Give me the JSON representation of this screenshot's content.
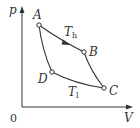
{
  "diagram": {
    "type": "pV-cycle",
    "axes": {
      "y_label": "p",
      "x_label": "V",
      "origin_label": "0"
    },
    "points": [
      {
        "name": "A",
        "x": 39,
        "y": 25
      },
      {
        "name": "B",
        "x": 84,
        "y": 52
      },
      {
        "name": "C",
        "x": 104,
        "y": 88
      },
      {
        "name": "D",
        "x": 52,
        "y": 72
      }
    ],
    "isotherms": {
      "hot": {
        "label": "T",
        "subscript": "h"
      },
      "cold": {
        "label": "T",
        "subscript": "l"
      }
    },
    "colors": {
      "stroke": "#333333",
      "background": "#ffffff"
    }
  }
}
